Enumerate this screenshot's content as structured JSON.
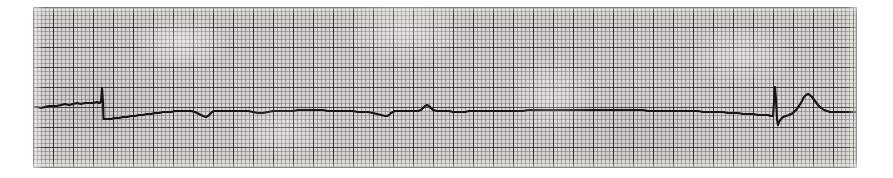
{
  "document": {
    "kind": "ecg-rhythm-strip",
    "caption": "",
    "width": 893,
    "height": 178
  },
  "paper": {
    "background_color": "#d8d6d2",
    "minor_grid_color": "#6e6c68",
    "major_grid_color": "#1c1b19",
    "minor_grid_px": 4,
    "major_grid_every": 5,
    "origin_x": 33,
    "origin_y": 7,
    "grid_width": 824,
    "grid_height": 161
  },
  "trace": {
    "color": "#141312",
    "stroke_width": 2.1,
    "baseline_y": 103,
    "lead_label": "",
    "rhythm_description": "near-flat agonal baseline with sparse wide complexes"
  },
  "chart_data": {
    "type": "line",
    "title": "",
    "subtitle": "",
    "xlabel": "",
    "ylabel": "",
    "grid": true,
    "legend": null,
    "xlim": [
      0,
      824
    ],
    "ylim": [
      161,
      0
    ],
    "series": [
      {
        "name": "ecg-lead-trace",
        "color": "#141312",
        "points": [
          [
            0,
            100
          ],
          [
            4,
            100
          ],
          [
            8,
            101
          ],
          [
            12,
            100
          ],
          [
            16,
            99
          ],
          [
            20,
            99
          ],
          [
            24,
            99
          ],
          [
            28,
            98
          ],
          [
            32,
            97
          ],
          [
            36,
            98
          ],
          [
            40,
            97
          ],
          [
            44,
            96
          ],
          [
            48,
            97
          ],
          [
            52,
            96
          ],
          [
            56,
            96
          ],
          [
            60,
            96
          ],
          [
            64,
            95
          ],
          [
            66,
            96
          ],
          [
            68,
            95
          ],
          [
            69,
            81
          ],
          [
            70,
            95
          ],
          [
            70.5,
            112
          ],
          [
            71,
            112
          ],
          [
            74,
            112
          ],
          [
            78,
            112
          ],
          [
            82,
            111
          ],
          [
            86,
            111
          ],
          [
            90,
            110
          ],
          [
            94,
            110
          ],
          [
            98,
            109
          ],
          [
            102,
            109
          ],
          [
            106,
            108
          ],
          [
            110,
            108
          ],
          [
            114,
            107
          ],
          [
            118,
            107
          ],
          [
            122,
            106
          ],
          [
            126,
            106
          ],
          [
            130,
            105
          ],
          [
            134,
            105
          ],
          [
            138,
            105
          ],
          [
            142,
            104
          ],
          [
            146,
            104
          ],
          [
            150,
            104
          ],
          [
            154,
            104
          ],
          [
            158,
            104
          ],
          [
            162,
            105
          ],
          [
            166,
            107
          ],
          [
            170,
            109
          ],
          [
            173,
            110
          ],
          [
            175,
            109
          ],
          [
            177,
            107
          ],
          [
            179,
            105
          ],
          [
            181,
            104
          ],
          [
            185,
            104
          ],
          [
            190,
            104
          ],
          [
            195,
            104
          ],
          [
            200,
            104
          ],
          [
            205,
            104
          ],
          [
            210,
            104
          ],
          [
            215,
            104
          ],
          [
            220,
            105
          ],
          [
            225,
            106
          ],
          [
            230,
            106
          ],
          [
            235,
            105
          ],
          [
            240,
            104
          ],
          [
            245,
            104
          ],
          [
            250,
            104
          ],
          [
            255,
            104
          ],
          [
            260,
            104
          ],
          [
            265,
            103
          ],
          [
            270,
            103
          ],
          [
            275,
            103
          ],
          [
            280,
            103
          ],
          [
            285,
            103
          ],
          [
            290,
            103
          ],
          [
            295,
            104
          ],
          [
            300,
            104
          ],
          [
            305,
            104
          ],
          [
            310,
            104
          ],
          [
            315,
            104
          ],
          [
            320,
            104
          ],
          [
            325,
            105
          ],
          [
            330,
            105
          ],
          [
            335,
            105
          ],
          [
            340,
            106
          ],
          [
            344,
            107
          ],
          [
            348,
            108
          ],
          [
            352,
            109
          ],
          [
            354,
            109
          ],
          [
            356,
            108
          ],
          [
            358,
            106
          ],
          [
            360,
            105
          ],
          [
            362,
            104
          ],
          [
            366,
            104
          ],
          [
            370,
            104
          ],
          [
            375,
            104
          ],
          [
            380,
            104
          ],
          [
            385,
            104
          ],
          [
            388,
            103
          ],
          [
            390,
            101
          ],
          [
            392,
            99
          ],
          [
            394,
            98
          ],
          [
            396,
            99
          ],
          [
            398,
            101
          ],
          [
            400,
            103
          ],
          [
            404,
            104
          ],
          [
            408,
            104
          ],
          [
            412,
            104
          ],
          [
            416,
            104
          ],
          [
            420,
            105
          ],
          [
            424,
            105
          ],
          [
            428,
            105
          ],
          [
            432,
            105
          ],
          [
            436,
            104
          ],
          [
            440,
            104
          ],
          [
            445,
            104
          ],
          [
            450,
            104
          ],
          [
            455,
            104
          ],
          [
            460,
            104
          ],
          [
            465,
            104
          ],
          [
            470,
            104
          ],
          [
            475,
            104
          ],
          [
            480,
            104
          ],
          [
            485,
            104
          ],
          [
            490,
            104
          ],
          [
            495,
            103
          ],
          [
            500,
            103
          ],
          [
            505,
            103
          ],
          [
            510,
            103
          ],
          [
            515,
            103
          ],
          [
            520,
            103
          ],
          [
            525,
            103
          ],
          [
            530,
            103
          ],
          [
            535,
            103
          ],
          [
            540,
            103
          ],
          [
            545,
            103
          ],
          [
            550,
            103
          ],
          [
            555,
            103
          ],
          [
            560,
            103
          ],
          [
            565,
            103
          ],
          [
            570,
            103
          ],
          [
            575,
            103
          ],
          [
            580,
            103
          ],
          [
            585,
            103
          ],
          [
            590,
            103
          ],
          [
            595,
            103
          ],
          [
            600,
            103
          ],
          [
            605,
            103
          ],
          [
            610,
            103
          ],
          [
            615,
            104
          ],
          [
            620,
            104
          ],
          [
            625,
            104
          ],
          [
            630,
            104
          ],
          [
            635,
            104
          ],
          [
            640,
            104
          ],
          [
            645,
            104
          ],
          [
            650,
            104
          ],
          [
            655,
            104
          ],
          [
            660,
            104
          ],
          [
            665,
            104
          ],
          [
            670,
            105
          ],
          [
            675,
            105
          ],
          [
            680,
            105
          ],
          [
            685,
            105
          ],
          [
            690,
            105
          ],
          [
            695,
            106
          ],
          [
            700,
            106
          ],
          [
            705,
            106
          ],
          [
            710,
            107
          ],
          [
            715,
            107
          ],
          [
            720,
            107
          ],
          [
            725,
            108
          ],
          [
            730,
            108
          ],
          [
            735,
            108
          ],
          [
            738,
            109
          ],
          [
            740,
            109
          ],
          [
            741,
            95
          ],
          [
            742,
            80
          ],
          [
            743,
            92
          ],
          [
            744,
            112
          ],
          [
            745,
            118
          ],
          [
            746,
            115
          ],
          [
            748,
            112
          ],
          [
            750,
            110
          ],
          [
            753,
            109
          ],
          [
            756,
            108
          ],
          [
            760,
            106
          ],
          [
            763,
            103
          ],
          [
            766,
            99
          ],
          [
            769,
            94
          ],
          [
            771,
            90
          ],
          [
            773,
            88
          ],
          [
            775,
            87
          ],
          [
            777,
            88
          ],
          [
            779,
            90
          ],
          [
            782,
            94
          ],
          [
            785,
            98
          ],
          [
            788,
            101
          ],
          [
            791,
            103
          ],
          [
            794,
            104
          ],
          [
            797,
            105
          ],
          [
            800,
            105
          ],
          [
            804,
            105
          ],
          [
            808,
            105
          ],
          [
            812,
            105
          ],
          [
            816,
            105
          ],
          [
            820,
            105
          ],
          [
            824,
            105
          ]
        ]
      }
    ],
    "annotations": [
      {
        "label": "qrs-spike-1",
        "x": 69,
        "y": 81
      },
      {
        "label": "notch-1",
        "x": 173,
        "y": 110
      },
      {
        "label": "notch-2",
        "x": 226,
        "y": 106
      },
      {
        "label": "notch-3",
        "x": 353,
        "y": 109
      },
      {
        "label": "bump-1",
        "x": 393,
        "y": 98
      },
      {
        "label": "qrs-spike-2",
        "x": 742,
        "y": 80
      },
      {
        "label": "t-wave-bump",
        "x": 775,
        "y": 87
      }
    ]
  }
}
